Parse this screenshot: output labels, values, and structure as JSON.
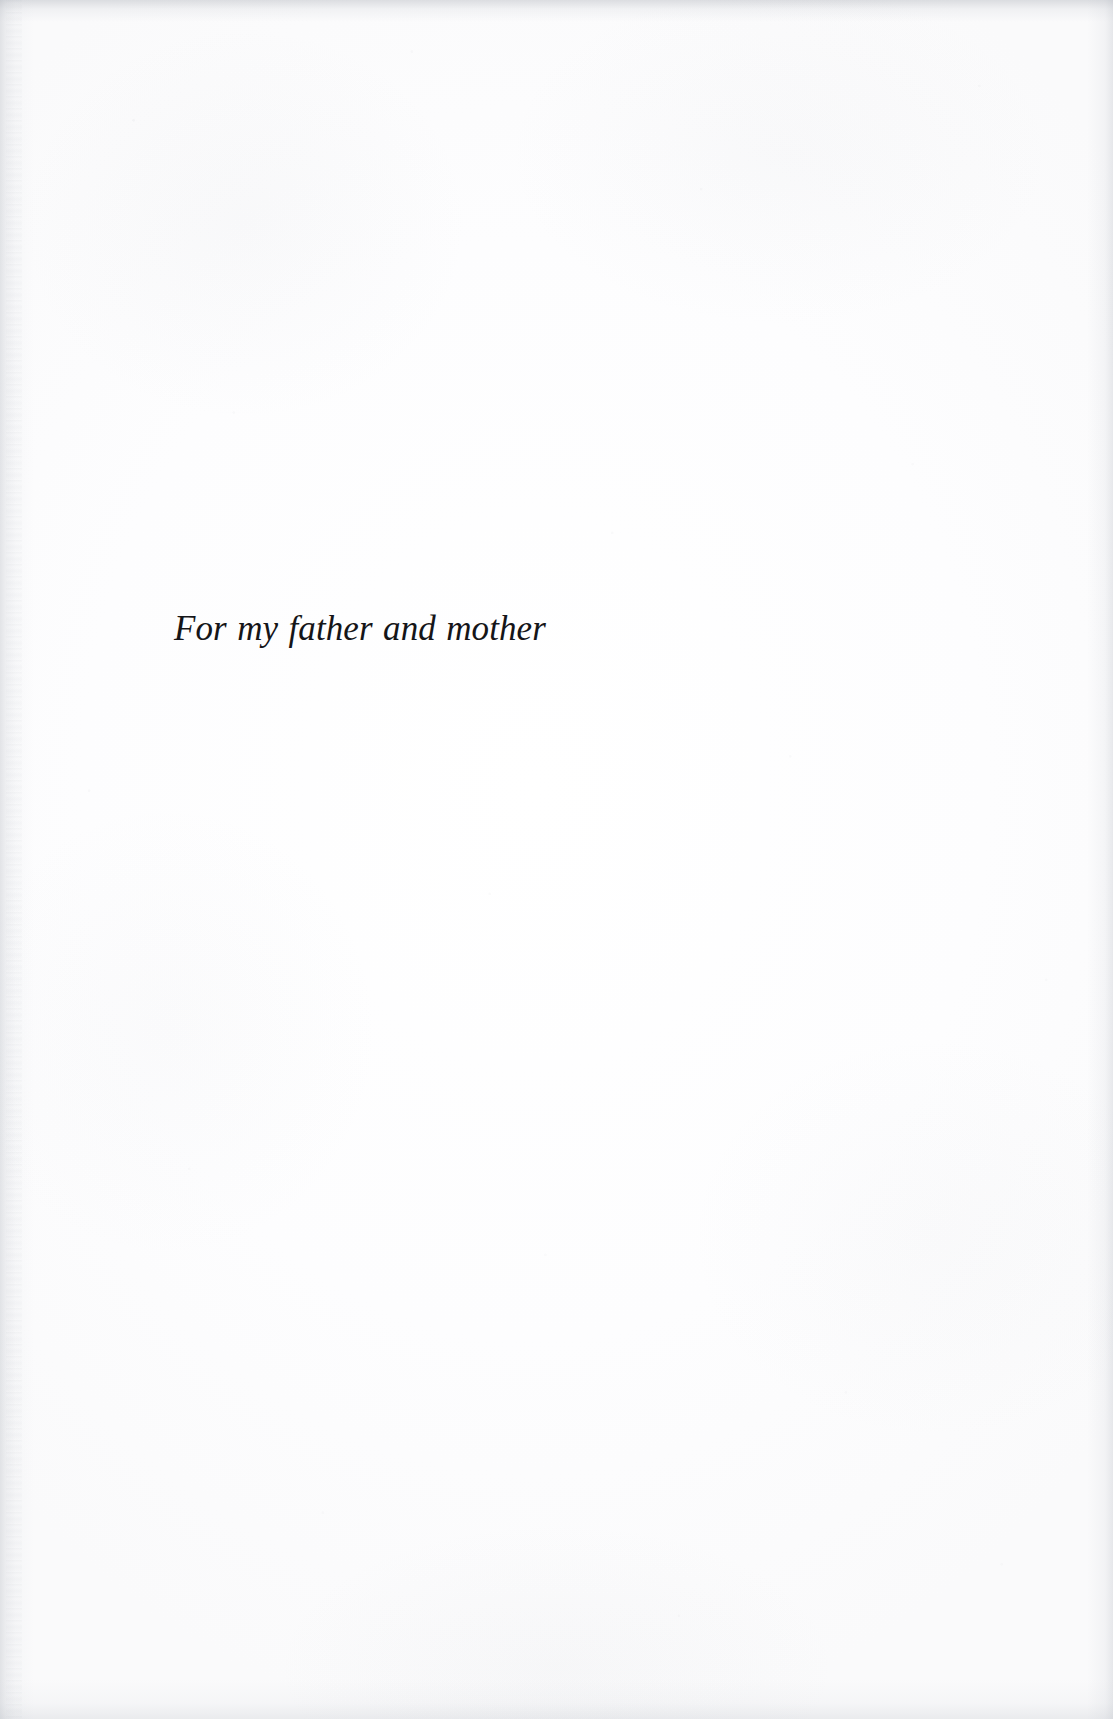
{
  "document": {
    "kind": "scanned-book-page",
    "page_type": "dedication",
    "paper_color": "#fdfdfe",
    "ink_color": "#151518",
    "body_text": "For my father and mother"
  },
  "dedication": {
    "text": "For my father and mother"
  }
}
